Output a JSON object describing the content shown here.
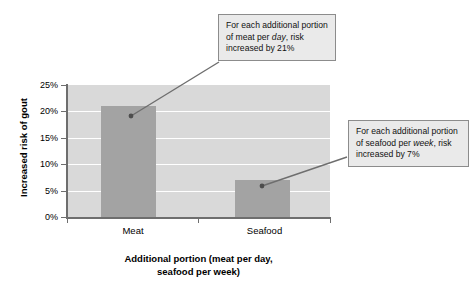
{
  "chart_data": {
    "type": "bar",
    "title": "",
    "categories": [
      "Meat",
      "Seafood"
    ],
    "values": [
      21,
      7
    ],
    "series": [
      {
        "name": "Increased risk of gout",
        "values": [
          21,
          7
        ]
      }
    ],
    "xlabel": "Additional portion (meat per day, seafood per week)",
    "ylabel": "Increased risk of gout",
    "ylim": [
      0,
      25
    ],
    "ytick_values": [
      0,
      5,
      10,
      15,
      20,
      25
    ],
    "ytick_labels": [
      "0%",
      "5%",
      "10%",
      "15%",
      "20%",
      "25%"
    ],
    "grid": "horizontal",
    "legend": "none",
    "bar_color": "#a3a3a3",
    "plot_background_color": "#d9d9d9",
    "gridline_color": "#ffffff",
    "axis_color": "#6e6e6e",
    "annotations": [
      {
        "id": "meat",
        "target_category": "Meat",
        "target_value": 21,
        "text_parts": [
          {
            "text": "For each additional portion of meat per ",
            "italic": false
          },
          {
            "text": "day",
            "italic": true
          },
          {
            "text": ", risk increased by 21%",
            "italic": false
          }
        ],
        "plain_text": "For each additional portion of meat per day, risk increased by 21%"
      },
      {
        "id": "seafood",
        "target_category": "Seafood",
        "target_value": 7,
        "text_parts": [
          {
            "text": "For each additional portion of seafood per ",
            "italic": false
          },
          {
            "text": "week",
            "italic": true
          },
          {
            "text": ", risk increased by 7%",
            "italic": false
          }
        ],
        "plain_text": "For each additional portion of seafood per week, risk increased by 7%"
      }
    ]
  },
  "axis": {
    "y_title": "Increased risk of gout",
    "x_title_line1": "Additional portion (meat per day,",
    "x_title_line2": "seafood per week)",
    "y_labels": {
      "t0": "0%",
      "t5": "5%",
      "t10": "10%",
      "t15": "15%",
      "t20": "20%",
      "t25": "25%"
    },
    "x_labels": {
      "meat": "Meat",
      "seafood": "Seafood"
    }
  },
  "callouts": {
    "meat": {
      "part1": "For each additional portion of meat per ",
      "emphasis": "day",
      "part2": ", risk increased by 21%"
    },
    "seafood": {
      "part1": "For each additional portion of seafood per ",
      "emphasis": "week",
      "part2": ", risk increased by 7%"
    }
  }
}
